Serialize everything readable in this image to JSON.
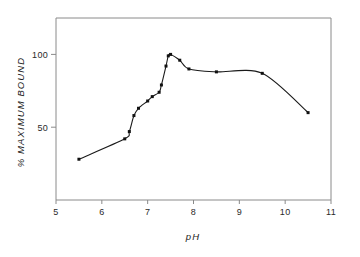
{
  "chart_data": {
    "type": "line",
    "title": "",
    "subtitle": "",
    "xlabel": "pH",
    "ylabel": "% MAXIMUM BOUND",
    "xlim": [
      5,
      11
    ],
    "ylim": [
      0,
      125
    ],
    "xticks": [
      5,
      6,
      7,
      8,
      9,
      10,
      11
    ],
    "xticklabels": [
      "5",
      "6",
      "7",
      "8",
      "9",
      "10",
      "11"
    ],
    "yticks": [
      50,
      100
    ],
    "yticklabels": [
      "50",
      "100"
    ],
    "grid": false,
    "legend": false,
    "marker": "filled-square",
    "line_color": "#1a1a1a",
    "marker_color": "#111111",
    "axis_color": "#8a8a8a",
    "background": "#ffffff",
    "x": [
      5.5,
      6.5,
      6.6,
      6.7,
      6.8,
      7.0,
      7.1,
      7.25,
      7.3,
      7.4,
      7.45,
      7.5,
      7.7,
      7.9,
      8.5,
      9.5,
      10.5
    ],
    "y": [
      28,
      42,
      47,
      58,
      63,
      68,
      71,
      74,
      79,
      92,
      99,
      100,
      96,
      90,
      88,
      87,
      60
    ],
    "series": [
      {
        "name": "% maximum bound vs pH",
        "values": [
          28,
          42,
          47,
          58,
          63,
          68,
          71,
          74,
          79,
          92,
          99,
          100,
          96,
          90,
          88,
          87,
          60
        ]
      }
    ],
    "annotations": []
  },
  "axes": {
    "x_axis_label": "pH",
    "y_axis_label": "% MAXIMUM BOUND"
  },
  "ticks": {
    "x": [
      {
        "value": 5,
        "label": "5"
      },
      {
        "value": 6,
        "label": "6"
      },
      {
        "value": 7,
        "label": "7"
      },
      {
        "value": 8,
        "label": "8"
      },
      {
        "value": 9,
        "label": "9"
      },
      {
        "value": 10,
        "label": "10"
      },
      {
        "value": 11,
        "label": "11"
      }
    ],
    "y": [
      {
        "value": 50,
        "label": "50"
      },
      {
        "value": 100,
        "label": "100"
      }
    ]
  }
}
